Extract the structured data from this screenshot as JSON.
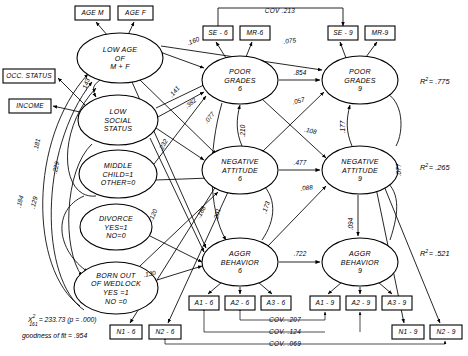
{
  "diagram": {
    "latent_variables": [
      {
        "id": "low-age",
        "label_lines": [
          "LOW  AGE",
          "OF",
          "M + F"
        ],
        "cx": 120,
        "cy": 58,
        "rx": 43,
        "ry": 25
      },
      {
        "id": "low-social-status",
        "label_lines": [
          "LOW",
          "SOCIAL",
          "STATUS"
        ],
        "cx": 118,
        "cy": 120,
        "rx": 40,
        "ry": 25
      },
      {
        "id": "middle-child",
        "label_lines": [
          "MIDDLE",
          "CHILD=1",
          "OTHER=0"
        ],
        "cx": 118,
        "cy": 174,
        "rx": 39,
        "ry": 24
      },
      {
        "id": "divorce",
        "label_lines": [
          "DIVORCE",
          "YES=1",
          "NO=0"
        ],
        "cx": 116,
        "cy": 227,
        "rx": 36,
        "ry": 23
      },
      {
        "id": "born-out-of-wedlock",
        "label_lines": [
          "BORN OUT",
          "OF  WEDLOCK",
          "YES =1",
          "NO =0"
        ],
        "cx": 116,
        "cy": 288,
        "rx": 42,
        "ry": 26
      },
      {
        "id": "poor-grades-6",
        "label_lines": [
          "POOR",
          "GRADES",
          "6"
        ],
        "cx": 240,
        "cy": 80,
        "rx": 38,
        "ry": 24
      },
      {
        "id": "poor-grades-9",
        "label_lines": [
          "POOR",
          "GRADES",
          "9"
        ],
        "cx": 360,
        "cy": 80,
        "rx": 38,
        "ry": 24
      },
      {
        "id": "negative-attitude-6",
        "label_lines": [
          "NEGATIVE",
          "ATTITUDE",
          "6"
        ],
        "cx": 240,
        "cy": 170,
        "rx": 38,
        "ry": 24
      },
      {
        "id": "negative-attitude-9",
        "label_lines": [
          "NEGATIVE",
          "ATTITUDE",
          "9"
        ],
        "cx": 360,
        "cy": 170,
        "rx": 38,
        "ry": 24
      },
      {
        "id": "aggr-behavior-6",
        "label_lines": [
          "AGGR",
          "BEHAVIOR",
          "6"
        ],
        "cx": 240,
        "cy": 262,
        "rx": 38,
        "ry": 24
      },
      {
        "id": "aggr-behavior-9",
        "label_lines": [
          "AGGR",
          "BEHAVIOR",
          "9"
        ],
        "cx": 360,
        "cy": 262,
        "rx": 38,
        "ry": 24
      }
    ],
    "indicator_boxes": [
      {
        "id": "age-m",
        "label": "AGE M",
        "x": 75,
        "y": 6,
        "w": 35,
        "h": 14
      },
      {
        "id": "age-f",
        "label": "AGE F",
        "x": 118,
        "y": 6,
        "w": 35,
        "h": 14
      },
      {
        "id": "occ-status",
        "label": "OCC. STATUS",
        "x": 3,
        "y": 69,
        "w": 52,
        "h": 14
      },
      {
        "id": "income",
        "label": "INCOME",
        "x": 9,
        "y": 99,
        "w": 42,
        "h": 14
      },
      {
        "id": "se-6",
        "label": "SE - 6",
        "x": 203,
        "y": 26,
        "w": 30,
        "h": 14
      },
      {
        "id": "mr-6",
        "label": "MR-6",
        "x": 240,
        "y": 26,
        "w": 30,
        "h": 14
      },
      {
        "id": "se-9",
        "label": "SE - 9",
        "x": 328,
        "y": 26,
        "w": 30,
        "h": 14
      },
      {
        "id": "mr-9",
        "label": "MR-9",
        "x": 365,
        "y": 26,
        "w": 30,
        "h": 14
      },
      {
        "id": "a1-6",
        "label": "A1 - 6",
        "x": 189,
        "y": 296,
        "w": 30,
        "h": 14
      },
      {
        "id": "a2-6",
        "label": "A2 - 6",
        "x": 225,
        "y": 296,
        "w": 30,
        "h": 14
      },
      {
        "id": "a3-6",
        "label": "A3 - 6",
        "x": 261,
        "y": 296,
        "w": 30,
        "h": 14
      },
      {
        "id": "a1-9",
        "label": "A1 - 9",
        "x": 310,
        "y": 296,
        "w": 30,
        "h": 14
      },
      {
        "id": "a2-9",
        "label": "A2 - 9",
        "x": 346,
        "y": 296,
        "w": 30,
        "h": 14
      },
      {
        "id": "a3-9",
        "label": "A3 - 9",
        "x": 382,
        "y": 296,
        "w": 30,
        "h": 14
      },
      {
        "id": "n1-6",
        "label": "N1 - 6",
        "x": 110,
        "y": 325,
        "w": 32,
        "h": 14
      },
      {
        "id": "n2-6",
        "label": "N2 - 6",
        "x": 149,
        "y": 325,
        "w": 32,
        "h": 14
      },
      {
        "id": "n1-9",
        "label": "N1 - 9",
        "x": 392,
        "y": 325,
        "w": 32,
        "h": 14
      },
      {
        "id": "n2-9",
        "label": "N2 - 9",
        "x": 430,
        "y": 325,
        "w": 32,
        "h": 14
      }
    ],
    "path_coefficients": [
      {
        "id": "coef-low-age-poor-grades-6",
        "value": ".160",
        "x": 194,
        "y": 43,
        "rotate": -22
      },
      {
        "id": "coef-low-age-poor-grades-9",
        "value": ".075",
        "x": 290,
        "y": 43,
        "rotate": -7
      },
      {
        "id": "coef-poor-grades-6-9",
        "value": ".854",
        "x": 300,
        "y": 75,
        "rotate": 0
      },
      {
        "id": "coef-neg-att-poor-grades-9",
        "value": ".057",
        "x": 299,
        "y": 103,
        "rotate": -14
      },
      {
        "id": "coef-poor-grades-6-neg-att-9",
        "value": ".108",
        "x": 310,
        "y": 133,
        "rotate": 12
      },
      {
        "id": "coef-neg-att-6-9",
        "value": ".477",
        "x": 300,
        "y": 165,
        "rotate": 0
      },
      {
        "id": "coef-neg-att-9-self",
        "value": ".177",
        "x": 345,
        "y": 127,
        "rotate": -90
      },
      {
        "id": "coef-poor-grades-neg-att-6",
        "value": ".210",
        "x": 245,
        "y": 131,
        "rotate": -90
      },
      {
        "id": "coef-neg-att-aggr-6",
        "value": ".173",
        "x": 268,
        "y": 208,
        "rotate": -72
      },
      {
        "id": "coef-aggr-6-neg-att-9",
        "value": ".088",
        "x": 307,
        "y": 190,
        "rotate": -8
      },
      {
        "id": "coef-aggr-6-9",
        "value": ".722",
        "x": 300,
        "y": 256,
        "rotate": 0
      },
      {
        "id": "coef-neg-att-9-aggr-9",
        "value": ".094",
        "x": 353,
        "y": 224,
        "rotate": -90
      },
      {
        "id": "coef-aggr-6-into",
        "value": ".188",
        "x": 203,
        "y": 213,
        "rotate": -62
      },
      {
        "id": "coef-aggr-6-into-2",
        "value": ".201",
        "x": 219,
        "y": 215,
        "rotate": -76
      },
      {
        "id": "coef-low-age-social",
        "value": ".143",
        "x": 88,
        "y": 85,
        "rotate": -72
      },
      {
        "id": "coef-social-poor-grades",
        "value": ".141",
        "x": 176,
        "y": 93,
        "rotate": -50
      },
      {
        "id": "coef-social-382",
        "value": ".382",
        "x": 192,
        "y": 105,
        "rotate": -38
      },
      {
        "id": "coef-social-077",
        "value": ".077",
        "x": 211,
        "y": 119,
        "rotate": -50
      },
      {
        "id": "coef-social-middle",
        "value": ".232",
        "x": 165,
        "y": 146,
        "rotate": -62
      },
      {
        "id": "coef-left-181",
        "value": ".181",
        "x": 39,
        "y": 145,
        "rotate": -78
      },
      {
        "id": "coef-left-229",
        "value": ".229",
        "x": 58,
        "y": 168,
        "rotate": -78
      },
      {
        "id": "coef-left-184",
        "value": ".184",
        "x": 22,
        "y": 202,
        "rotate": -76
      },
      {
        "id": "coef-left-129",
        "value": ".129",
        "x": 36,
        "y": 203,
        "rotate": -76
      },
      {
        "id": "coef-wedlock-120",
        "value": ".120",
        "x": 155,
        "y": 216,
        "rotate": -66
      },
      {
        "id": "coef-wedlock-130",
        "value": ".130",
        "x": 150,
        "y": 276,
        "rotate": -10
      },
      {
        "id": "coef-right-077",
        "value": ".077",
        "x": 401,
        "y": 170,
        "rotate": -90
      }
    ],
    "covariances": [
      {
        "id": "cov-se6-se9",
        "label": "COV   .213",
        "x": 280,
        "y": 13
      },
      {
        "id": "cov-207",
        "label": "COV.  .207",
        "x": 285,
        "y": 322
      },
      {
        "id": "cov-124",
        "label": "COV.  .124",
        "x": 285,
        "y": 334
      },
      {
        "id": "cov-069",
        "label": "COV.  .069",
        "x": 285,
        "y": 346
      }
    ],
    "r_squared": [
      {
        "id": "r2-poor-grades-9",
        "prefix": "R",
        "sup": "2",
        "value": "= .775",
        "x": 420,
        "y": 84
      },
      {
        "id": "r2-negative-attitude-9",
        "prefix": "R",
        "sup": "2",
        "value": "= .265",
        "x": 420,
        "y": 170
      },
      {
        "id": "r2-aggr-behavior-9",
        "prefix": "R",
        "sup": "2",
        "value": "= .521",
        "x": 420,
        "y": 256
      }
    ],
    "fit_statistics": {
      "chi_symbol": "X",
      "chi_sup": "2",
      "chi_sub": "161",
      "chi_value": "= 233.73 (p = .000)",
      "gof_label": "goodness of fit  = .954"
    }
  }
}
